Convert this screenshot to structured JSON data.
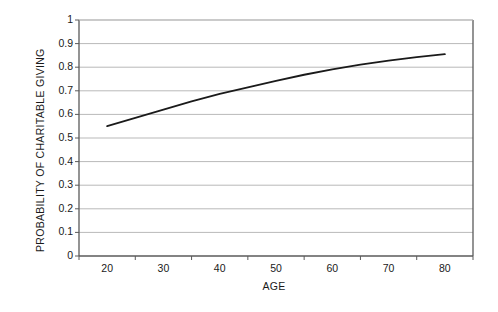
{
  "chart_data": {
    "type": "line",
    "title": "",
    "xlabel": "AGE",
    "ylabel": "PROBABILITY OF CHARITABLE GIVING",
    "x": [
      20,
      25,
      30,
      35,
      40,
      45,
      50,
      55,
      60,
      65,
      70,
      75,
      80
    ],
    "series": [
      {
        "name": "Probability of charitable giving",
        "values": [
          0.55,
          0.585,
          0.62,
          0.655,
          0.687,
          0.715,
          0.742,
          0.768,
          0.791,
          0.811,
          0.828,
          0.843,
          0.855
        ],
        "color": "#1a1a1a",
        "width": 1.8
      }
    ],
    "xlim": [
      20,
      80
    ],
    "ylim": [
      0,
      1
    ],
    "ytick_values": [
      0,
      0.1,
      0.2,
      0.3,
      0.4,
      0.5,
      0.6,
      0.7,
      0.8,
      0.9,
      1
    ],
    "ytick_labels": [
      "0",
      "0.1",
      "0.2",
      "0.3",
      "0.4",
      "0.5",
      "0.6",
      "0.7",
      "0.8",
      "0.9",
      "1"
    ],
    "xtick_values": [
      20,
      30,
      40,
      50,
      60,
      70,
      80
    ],
    "xtick_labels": [
      "20",
      "30",
      "40",
      "50",
      "60",
      "70",
      "80"
    ],
    "grid": {
      "horizontal": true,
      "vertical": false,
      "color": "#b9b9b9"
    },
    "legend": null,
    "plot_border_color": "#5a5a5a",
    "background": "#ffffff"
  }
}
